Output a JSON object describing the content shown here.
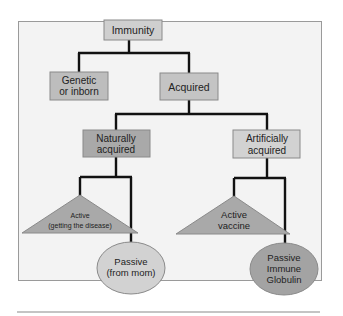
{
  "diagram": {
    "type": "tree",
    "colors": {
      "frame_fill": "#f3f3f3",
      "frame_stroke": "#9a9a9a",
      "connector": "#111111",
      "immunity_fill": "#cfcfcf",
      "genetic_fill": "#bdbdbd",
      "acquired_fill": "#c4c4c4",
      "natural_fill": "#a9a9a9",
      "artificial_fill": "#d2d2d2",
      "triangle_fill": "#a9a9a9",
      "passive_mom_fill": "#d2d2d2",
      "passive_globulin_fill": "#a3a3a3",
      "rule": "#8a8a8a"
    },
    "nodes": {
      "immunity": {
        "label": "Immunity"
      },
      "genetic": {
        "line1": "Genetic",
        "line2": "or inborn"
      },
      "acquired": {
        "label": "Acquired"
      },
      "naturally": {
        "line1": "Naturally",
        "line2": "acquired"
      },
      "artificially": {
        "line1": "Artificially",
        "line2": "acquired"
      },
      "active_disease": {
        "line1": "Active",
        "line2": "(getting the disease)"
      },
      "passive_mom": {
        "line1": "Passive",
        "line2": "(from mom)"
      },
      "active_vaccine": {
        "line1": "Active",
        "line2": "vaccine"
      },
      "passive_globulin": {
        "line1": "Passive",
        "line2": "Immune",
        "line3": "Globulin"
      }
    },
    "edges": [
      [
        "Immunity",
        "Genetic or inborn"
      ],
      [
        "Immunity",
        "Acquired"
      ],
      [
        "Acquired",
        "Naturally acquired"
      ],
      [
        "Acquired",
        "Artificially acquired"
      ],
      [
        "Naturally acquired",
        "Active (getting the disease)"
      ],
      [
        "Naturally acquired",
        "Passive (from mom)"
      ],
      [
        "Artificially acquired",
        "Active vaccine"
      ],
      [
        "Artificially acquired",
        "Passive Immune Globulin"
      ]
    ]
  }
}
